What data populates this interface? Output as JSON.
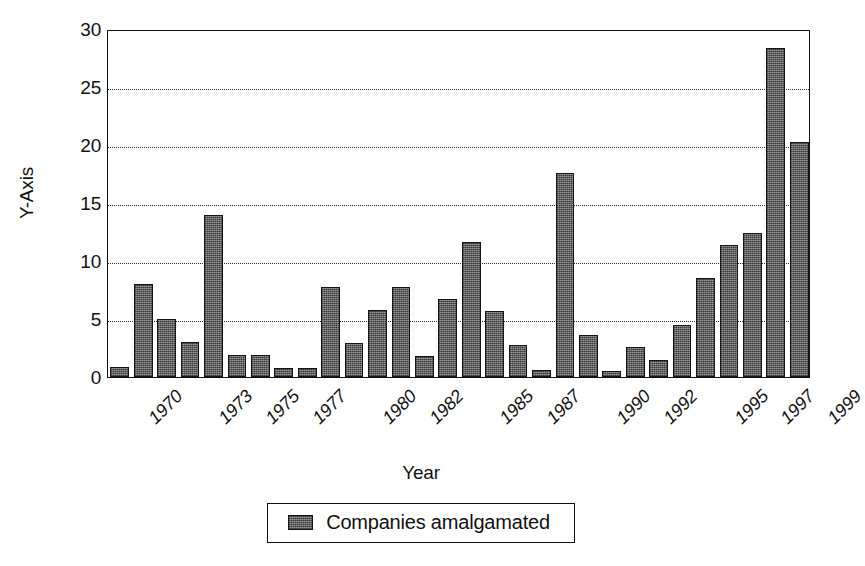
{
  "chart_data": {
    "type": "bar",
    "title": "",
    "subtitle": "",
    "xlabel": "Year",
    "ylabel": "Y-Axis",
    "ylim": [
      0,
      30
    ],
    "ytick_values": [
      0,
      5,
      10,
      15,
      20,
      25,
      30
    ],
    "ytick_labels": [
      "0",
      "5",
      "10",
      "15",
      "20",
      "25",
      "30"
    ],
    "grid": "horizontal-dotted",
    "grid_at": [
      5,
      10,
      15,
      20,
      25
    ],
    "legend_position": "bottom-center",
    "series": [
      {
        "name": "Companies amalgamated",
        "color": "#6e6e6e",
        "values": [
          0.9,
          8.0,
          5.0,
          3.0,
          14.0,
          1.9,
          1.9,
          0.8,
          0.8,
          7.8,
          2.9,
          5.8,
          7.8,
          1.8,
          6.7,
          11.6,
          5.7,
          2.8,
          0.6,
          17.6,
          3.6,
          0.5,
          2.6,
          1.5,
          4.5,
          8.5,
          11.4,
          12.4,
          28.4,
          20.3
        ]
      }
    ],
    "categories": [
      "1970",
      "1971",
      "1972",
      "1973",
      "1974",
      "1975",
      "1976",
      "1977",
      "1978",
      "1979",
      "1980",
      "1981",
      "1982",
      "1983",
      "1984",
      "1985",
      "1986",
      "1987",
      "1988",
      "1989",
      "1990",
      "1991",
      "1992",
      "1993",
      "1994",
      "1995",
      "1996",
      "1997",
      "1998",
      "1999"
    ],
    "xtick_labels": [
      "1970",
      "1973",
      "1975",
      "1977",
      "1980",
      "1982",
      "1985",
      "1987",
      "1990",
      "1992",
      "1995",
      "1997",
      "1999"
    ],
    "xtick_category_index": [
      0,
      3,
      5,
      7,
      10,
      12,
      15,
      17,
      20,
      22,
      25,
      27,
      29
    ]
  },
  "legend": {
    "items": [
      {
        "label": "Companies amalgamated",
        "color": "#6e6e6e"
      }
    ]
  },
  "colors": {
    "bar_fill": "#6e6e6e",
    "bar_stroke": "#141414",
    "axis": "#111111",
    "grid": "#2a2a2a",
    "background": "#ffffff"
  }
}
